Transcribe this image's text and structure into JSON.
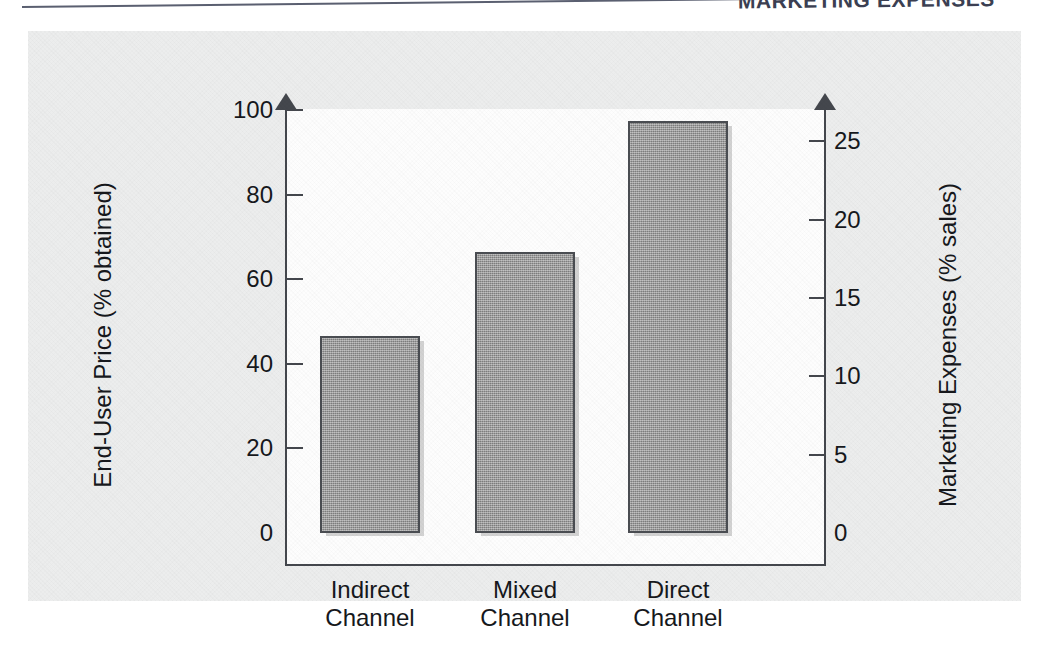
{
  "header": {
    "title": "MARKETING EXPENSES"
  },
  "chart_data": {
    "type": "bar",
    "title": "",
    "categories": [
      "Indirect Channel",
      "Mixed Channel",
      "Direct Channel"
    ],
    "category_lines": [
      [
        "Indirect",
        "Channel"
      ],
      [
        "Mixed",
        "Channel"
      ],
      [
        "Direct",
        "Channel"
      ]
    ],
    "values": [
      46.5,
      66.5,
      97.5
    ],
    "xlabel": "",
    "ylabel": "End-User Price (% obtained)",
    "ylabel_right": "Marketing Expenses (% sales)",
    "ylim": [
      0,
      100
    ],
    "ylim_right": [
      0,
      27
    ],
    "yticks": [
      0,
      20,
      40,
      60,
      80,
      100
    ],
    "yticks_right": [
      0,
      5,
      10,
      15,
      20,
      25
    ],
    "grid": false,
    "legend": null,
    "bar_color": "#8d8d8d",
    "bar_edge_color": "#4a4d52",
    "axis_color": "#44474d",
    "panel_color": "#eceded",
    "plot_background": "#fdfdfd"
  }
}
